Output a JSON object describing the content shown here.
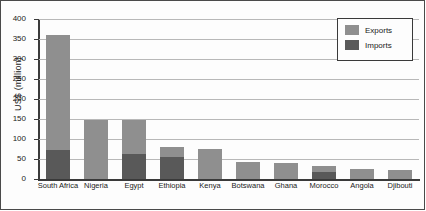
{
  "chart_data": {
    "type": "bar",
    "title": "",
    "xlabel": "",
    "ylabel": "US$ (million)",
    "ylim": [
      0,
      400
    ],
    "yticks": [
      0,
      50,
      100,
      150,
      200,
      250,
      300,
      350,
      400
    ],
    "grid": true,
    "legend_position": "top-right",
    "stacked": true,
    "categories": [
      "South Africa",
      "Nigeria",
      "Egypt",
      "Ethiopia",
      "Kenya",
      "Botswana",
      "Ghana",
      "Morocco",
      "Angola",
      "Djibouti"
    ],
    "series": [
      {
        "name": "Exports",
        "color": "#8f8f8f",
        "values": [
          360,
          148,
          148,
          80,
          75,
          43,
          40,
          33,
          25,
          22
        ]
      },
      {
        "name": "Imports",
        "color": "#595959",
        "values": [
          72,
          0,
          62,
          55,
          0,
          0,
          0,
          18,
          0,
          0
        ]
      }
    ]
  },
  "legend": {
    "items": [
      {
        "label": "Exports",
        "color": "#8f8f8f"
      },
      {
        "label": "Imports",
        "color": "#595959"
      }
    ]
  },
  "axis": {
    "y_title": "US$ (million)"
  }
}
